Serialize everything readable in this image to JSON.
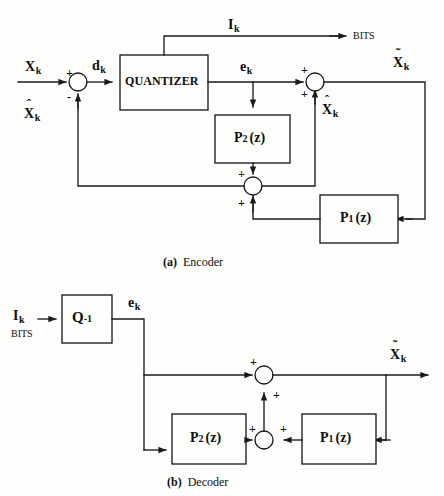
{
  "figure": {
    "background_color": "#fdfdfb",
    "line_color": "#1a1a1a"
  },
  "encoder": {
    "caption_tag": "(a)",
    "caption_text": "Encoder",
    "blocks": [
      {
        "id": "quantizer",
        "label": "QUANTIZER",
        "x": 120,
        "y": 55,
        "w": 88,
        "h": 55
      },
      {
        "id": "p2",
        "label_main": "P",
        "label_sub": "2",
        "label_tail": "(z)",
        "x": 215,
        "y": 115,
        "w": 75,
        "h": 48
      },
      {
        "id": "p1",
        "label_main": "P",
        "label_sub": "1",
        "label_tail": "(z)",
        "x": 320,
        "y": 195,
        "w": 78,
        "h": 48
      }
    ],
    "signals": [
      {
        "id": "x-in",
        "label": "X",
        "sub": "k",
        "accent": "none"
      },
      {
        "id": "x-hat-fb",
        "label": "X",
        "sub": "k",
        "accent": "hat"
      },
      {
        "id": "d",
        "label": "d",
        "sub": "k",
        "accent": "none"
      },
      {
        "id": "i-out",
        "label": "I",
        "sub": "k",
        "accent": "none"
      },
      {
        "id": "bits-out",
        "label": "BITS"
      },
      {
        "id": "e",
        "label": "e",
        "sub": "k",
        "accent": "none"
      },
      {
        "id": "x-hat-sum",
        "label": "X",
        "sub": "k",
        "accent": "hat"
      },
      {
        "id": "x-tilde-out",
        "label": "X",
        "sub": "k",
        "accent": "tilde"
      }
    ],
    "sum_junctions": [
      {
        "id": "input-summer",
        "cx": 78,
        "cy": 82,
        "r": 9,
        "signs": [
          {
            "label": "+",
            "position": "top-left"
          },
          {
            "label": "-",
            "position": "bottom-left"
          }
        ]
      },
      {
        "id": "reconstruct-summer",
        "cx": 315,
        "cy": 82,
        "r": 9,
        "signs": [
          {
            "label": "+",
            "position": "top-left"
          },
          {
            "label": "+",
            "position": "bottom-left"
          }
        ]
      },
      {
        "id": "predictor-summer",
        "cx": 253,
        "cy": 186,
        "r": 9,
        "signs": [
          {
            "label": "+",
            "position": "top-left"
          },
          {
            "label": "+",
            "position": "bottom-left"
          }
        ]
      }
    ]
  },
  "decoder": {
    "caption_tag": "(b)",
    "caption_text": "Decoder",
    "blocks": [
      {
        "id": "q-inverse",
        "label_main": "Q",
        "label_sup": "-1",
        "x": 62,
        "y": 295,
        "w": 50,
        "h": 48
      },
      {
        "id": "p2",
        "label_main": "P",
        "label_sub": "2",
        "label_tail": "(z)",
        "x": 172,
        "y": 414,
        "w": 74,
        "h": 50
      },
      {
        "id": "p1",
        "label_main": "P",
        "label_sub": "1",
        "label_tail": "(z)",
        "x": 302,
        "y": 414,
        "w": 74,
        "h": 50
      }
    ],
    "signals": [
      {
        "id": "i-in",
        "label": "I",
        "sub": "k",
        "accent": "none"
      },
      {
        "id": "bits-in",
        "label": "BITS"
      },
      {
        "id": "e",
        "label": "e",
        "sub": "k",
        "accent": "none"
      },
      {
        "id": "x-tilde-out",
        "label": "X",
        "sub": "k",
        "accent": "tilde"
      }
    ],
    "sum_junctions": [
      {
        "id": "output-summer",
        "cx": 264,
        "cy": 375,
        "r": 9,
        "signs": [
          {
            "label": "+",
            "position": "top-left"
          },
          {
            "label": "+",
            "position": "bottom-right"
          }
        ]
      },
      {
        "id": "predictor-summer",
        "cx": 264,
        "cy": 440,
        "r": 9,
        "signs": [
          {
            "label": "+",
            "position": "top-left"
          },
          {
            "label": "+",
            "position": "top-right"
          }
        ]
      }
    ]
  }
}
